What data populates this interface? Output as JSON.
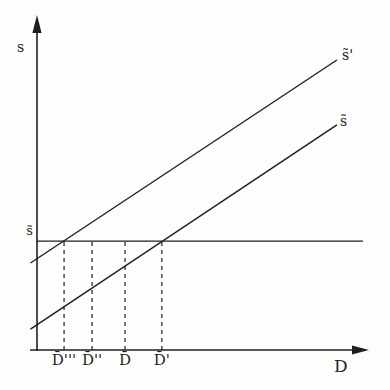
{
  "figure": {
    "background_color": "#fdfdfb",
    "ink_color": "#1f1f1f"
  },
  "chart_data": {
    "type": "line",
    "title": "",
    "xlabel": "D",
    "ylabel": "s",
    "numeric_axes": false,
    "coord_units": "fraction of plot area (diagram has no numeric scale)",
    "xlim": [
      0,
      1
    ],
    "ylim": [
      0,
      1
    ],
    "grid": false,
    "level_line": {
      "label": "s̃",
      "y": 0.369,
      "x_start": 0,
      "x_end": 1
    },
    "series": [
      {
        "name": "upper-sloped-line",
        "label": "s̃'",
        "points": [
          [
            -0.02,
            0.295
          ],
          [
            0.92,
            0.983
          ]
        ]
      },
      {
        "name": "lower-sloped-line",
        "label": "s̃",
        "points": [
          [
            -0.02,
            0.071
          ],
          [
            0.92,
            0.763
          ]
        ]
      }
    ],
    "x_marks": [
      {
        "label": "D̄'''",
        "x": 0.083
      },
      {
        "label": "D̄''",
        "x": 0.169
      },
      {
        "label": "D̄",
        "x": 0.27
      },
      {
        "label": "D̄'",
        "x": 0.383
      }
    ],
    "annotations": "Dashed verticals at each D̄ mark run from the x-axis up to the horizontal s̃ level line; the upper line crosses the s̃ level at D̄''' and the lower line crosses it at D̄'."
  }
}
